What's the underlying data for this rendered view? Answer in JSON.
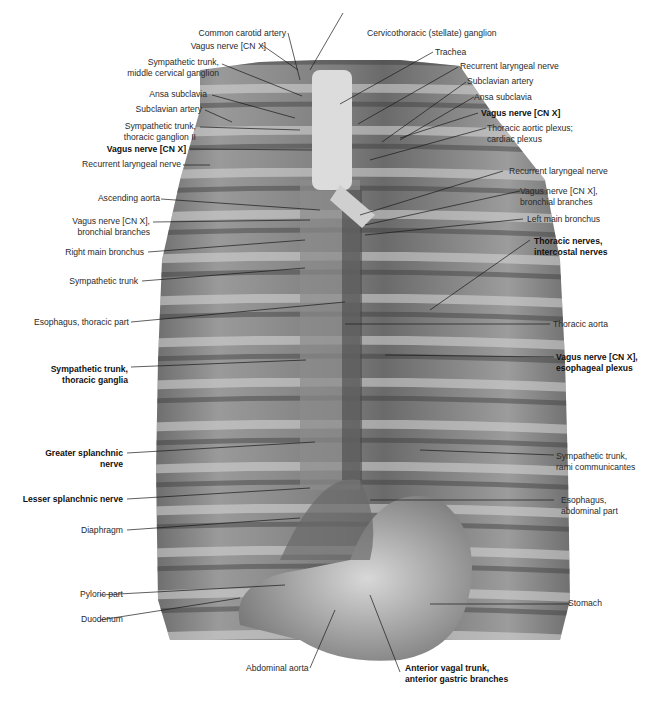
{
  "figure": {
    "colors": {
      "background": "#ffffff",
      "label_text": "#2a2a2a",
      "leader_line": "#1a1a1a",
      "illustration_tone": "#8a8a8a"
    }
  },
  "labels_left": [
    {
      "id": "common-carotid-artery",
      "lines": [
        "Common carotid artery"
      ],
      "bold": false
    },
    {
      "id": "vagus-nerve-1",
      "lines": [
        "Vagus nerve [CN X]"
      ],
      "bold": false
    },
    {
      "id": "sympathetic-trunk-middle-cervical",
      "lines": [
        "Sympathetic trunk,",
        "middle cervical ganglion"
      ],
      "bold": false
    },
    {
      "id": "ansa-subclavia-left",
      "lines": [
        "Ansa subclavia"
      ],
      "bold": false
    },
    {
      "id": "subclavian-artery-left",
      "lines": [
        "Subclavian artery"
      ],
      "bold": false
    },
    {
      "id": "sympathetic-trunk-thoracic-ganglion-ii",
      "lines": [
        "Sympathetic trunk,",
        "thoracic ganglion II"
      ],
      "bold": false
    },
    {
      "id": "vagus-nerve-2",
      "lines": [
        "Vagus nerve [CN X]"
      ],
      "bold": true
    },
    {
      "id": "recurrent-laryngeal-left",
      "lines": [
        "Recurrent laryngeal nerve"
      ],
      "bold": false
    },
    {
      "id": "ascending-aorta",
      "lines": [
        "Ascending aorta"
      ],
      "bold": false
    },
    {
      "id": "vagus-bronchial-left",
      "lines": [
        "Vagus nerve [CN X],",
        "bronchial branches"
      ],
      "bold": false
    },
    {
      "id": "right-main-bronchus",
      "lines": [
        "Right main bronchus"
      ],
      "bold": false
    },
    {
      "id": "sympathetic-trunk",
      "lines": [
        "Sympathetic trunk"
      ],
      "bold": false
    },
    {
      "id": "esophagus-thoracic",
      "lines": [
        "Esophagus, thoracic part"
      ],
      "bold": false
    },
    {
      "id": "sympathetic-trunk-thoracic-ganglia",
      "lines": [
        "Sympathetic trunk,",
        "thoracic ganglia"
      ],
      "bold": true
    },
    {
      "id": "greater-splanchnic",
      "lines": [
        "Greater splanchnic",
        "nerve"
      ],
      "bold": true
    },
    {
      "id": "lesser-splanchnic",
      "lines": [
        "Lesser splanchnic nerve"
      ],
      "bold": true
    },
    {
      "id": "diaphragm",
      "lines": [
        "Diaphragm"
      ],
      "bold": false
    },
    {
      "id": "pyloric-part",
      "lines": [
        "Pyloric part"
      ],
      "bold": false
    },
    {
      "id": "duodenum",
      "lines": [
        "Duodenum"
      ],
      "bold": false
    }
  ],
  "labels_right": [
    {
      "id": "cervicothoracic-ganglion",
      "lines": [
        "Cervicothoracic (stellate) ganglion"
      ],
      "bold": false
    },
    {
      "id": "trachea",
      "lines": [
        "Trachea"
      ],
      "bold": false
    },
    {
      "id": "recurrent-laryngeal-right-1",
      "lines": [
        "Recurrent laryngeal nerve"
      ],
      "bold": false
    },
    {
      "id": "subclavian-artery-right",
      "lines": [
        "Subclavian artery"
      ],
      "bold": false
    },
    {
      "id": "ansa-subclavia-right",
      "lines": [
        "Ansa subclavia"
      ],
      "bold": false
    },
    {
      "id": "vagus-nerve-right",
      "lines": [
        "Vagus nerve [CN X]"
      ],
      "bold": true
    },
    {
      "id": "thoracic-aortic-plexus",
      "lines": [
        "Thoracic aortic plexus;",
        "cardiac plexus"
      ],
      "bold": false
    },
    {
      "id": "recurrent-laryngeal-right-2",
      "lines": [
        "Recurrent laryngeal nerve"
      ],
      "bold": false
    },
    {
      "id": "vagus-bronchial-right",
      "lines": [
        "Vagus nerve [CN X],",
        "bronchial branches"
      ],
      "bold": false
    },
    {
      "id": "left-main-bronchus",
      "lines": [
        "Left main bronchus"
      ],
      "bold": false
    },
    {
      "id": "thoracic-intercostal-nerves",
      "lines": [
        "Thoracic nerves,",
        "intercostal nerves"
      ],
      "bold": true
    },
    {
      "id": "thoracic-aorta",
      "lines": [
        "Thoracic aorta"
      ],
      "bold": false
    },
    {
      "id": "vagus-esophageal-plexus",
      "lines": [
        "Vagus nerve [CN X],",
        "esophageal plexus"
      ],
      "bold": true
    },
    {
      "id": "sympathetic-rami-communicantes",
      "lines": [
        "Sympathetic trunk,",
        "rami communicantes"
      ],
      "bold": false
    },
    {
      "id": "esophagus-abdominal",
      "lines": [
        "Esophagus,",
        "abdominal part"
      ],
      "bold": false
    },
    {
      "id": "stomach",
      "lines": [
        "Stomach"
      ],
      "bold": false
    }
  ],
  "labels_bottom": [
    {
      "id": "abdominal-aorta",
      "lines": [
        "Abdominal aorta"
      ],
      "bold": false
    },
    {
      "id": "anterior-vagal-trunk",
      "lines": [
        "Anterior vagal trunk,",
        "anterior gastric branches"
      ],
      "bold": true
    }
  ]
}
